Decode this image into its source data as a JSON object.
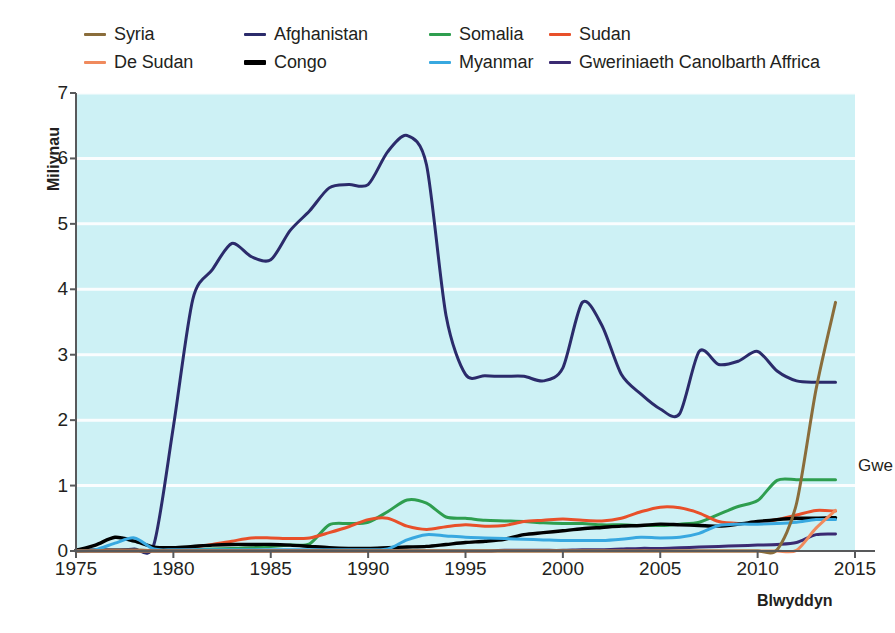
{
  "legend": {
    "items": [
      {
        "label": "Syria",
        "color": "#8a6d3b",
        "thick": false
      },
      {
        "label": "Afghanistan",
        "color": "#2b2b6b",
        "thick": false
      },
      {
        "label": "Somalia",
        "color": "#2e9e4f",
        "thick": false
      },
      {
        "label": "Sudan",
        "color": "#e8502a",
        "thick": false
      },
      {
        "label": "De Sudan",
        "color": "#f08a5d",
        "thick": false
      },
      {
        "label": "Congo",
        "color": "#000000",
        "thick": true
      },
      {
        "label": "Myanmar",
        "color": "#38a8e0",
        "thick": false
      },
      {
        "label": "Gweriniaeth Canolbarth Affrica",
        "color": "#3b2a72",
        "thick": false
      }
    ]
  },
  "annotation_right": "Gwe",
  "style": {
    "plot_background": "#cdf1f5",
    "gridline_color": "#ffffff",
    "axis_color": "#58595b",
    "text_color": "#231f20"
  },
  "chart_data": {
    "type": "line",
    "title": "",
    "xlabel": "Blwyddyn",
    "ylabel": "Miliynau",
    "xlim": [
      1975,
      2015
    ],
    "ylim": [
      0,
      7
    ],
    "xticks": [
      1975,
      1980,
      1985,
      1990,
      1995,
      2000,
      2005,
      2010,
      2015
    ],
    "yticks": [
      0,
      1,
      2,
      3,
      4,
      5,
      6,
      7
    ],
    "grid": "horizontal",
    "legend_position": "above-plot",
    "x": [
      1975,
      1976,
      1977,
      1978,
      1979,
      1980,
      1981,
      1982,
      1983,
      1984,
      1985,
      1986,
      1987,
      1988,
      1989,
      1990,
      1991,
      1992,
      1993,
      1994,
      1995,
      1996,
      1997,
      1998,
      1999,
      2000,
      2001,
      2002,
      2003,
      2004,
      2005,
      2006,
      2007,
      2008,
      2009,
      2010,
      2011,
      2012,
      2013,
      2014
    ],
    "series": [
      {
        "name": "Afghanistan",
        "color": "#2b2b6b",
        "values": [
          0.02,
          0.02,
          0.02,
          0.03,
          0.1,
          1.9,
          3.85,
          4.3,
          4.7,
          4.5,
          4.45,
          4.9,
          5.2,
          5.55,
          5.6,
          5.6,
          6.1,
          6.35,
          5.9,
          3.6,
          2.7,
          2.68,
          2.67,
          2.67,
          2.6,
          2.8,
          3.8,
          3.45,
          2.7,
          2.4,
          2.17,
          2.1,
          3.05,
          2.85,
          2.9,
          3.05,
          2.75,
          2.6,
          2.58,
          2.58
        ]
      },
      {
        "name": "Syria",
        "color": "#8a6d3b",
        "values": [
          0,
          0,
          0,
          0,
          0,
          0,
          0,
          0,
          0,
          0,
          0,
          0,
          0,
          0,
          0,
          0,
          0,
          0,
          0,
          0,
          0,
          0,
          0,
          0,
          0,
          0,
          0,
          0,
          0,
          0,
          0,
          0,
          0,
          0,
          0,
          0,
          0.02,
          0.73,
          2.47,
          3.8
        ]
      },
      {
        "name": "Somalia",
        "color": "#2e9e4f",
        "values": [
          0.01,
          0.01,
          0.01,
          0.01,
          0.01,
          0.02,
          0.02,
          0.03,
          0.04,
          0.05,
          0.07,
          0.09,
          0.11,
          0.4,
          0.42,
          0.44,
          0.6,
          0.78,
          0.73,
          0.52,
          0.5,
          0.47,
          0.46,
          0.45,
          0.43,
          0.42,
          0.42,
          0.4,
          0.4,
          0.39,
          0.39,
          0.41,
          0.44,
          0.56,
          0.68,
          0.77,
          1.08,
          1.09,
          1.09,
          1.09
        ]
      },
      {
        "name": "Sudan",
        "color": "#e8502a",
        "values": [
          0.01,
          0.01,
          0.01,
          0.01,
          0.01,
          0.02,
          0.06,
          0.1,
          0.15,
          0.2,
          0.2,
          0.19,
          0.2,
          0.28,
          0.37,
          0.48,
          0.5,
          0.38,
          0.33,
          0.37,
          0.4,
          0.38,
          0.39,
          0.45,
          0.47,
          0.49,
          0.47,
          0.46,
          0.5,
          0.6,
          0.67,
          0.66,
          0.58,
          0.45,
          0.42,
          0.43,
          0.48,
          0.55,
          0.62,
          0.61
        ]
      },
      {
        "name": "Congo",
        "color": "#000000",
        "values": [
          0.01,
          0.09,
          0.21,
          0.15,
          0.06,
          0.05,
          0.07,
          0.09,
          0.1,
          0.1,
          0.1,
          0.09,
          0.07,
          0.05,
          0.04,
          0.04,
          0.05,
          0.06,
          0.07,
          0.1,
          0.13,
          0.15,
          0.18,
          0.25,
          0.28,
          0.31,
          0.34,
          0.36,
          0.38,
          0.39,
          0.41,
          0.4,
          0.39,
          0.38,
          0.41,
          0.45,
          0.48,
          0.5,
          0.5,
          0.51
        ]
      },
      {
        "name": "Myanmar",
        "color": "#38a8e0",
        "values": [
          0,
          0.02,
          0.12,
          0.2,
          0.03,
          0.02,
          0.02,
          0.02,
          0.02,
          0.02,
          0.02,
          0.02,
          0.02,
          0.02,
          0.02,
          0.02,
          0.03,
          0.17,
          0.25,
          0.23,
          0.21,
          0.2,
          0.19,
          0.18,
          0.17,
          0.16,
          0.16,
          0.16,
          0.18,
          0.21,
          0.2,
          0.21,
          0.27,
          0.39,
          0.41,
          0.41,
          0.42,
          0.44,
          0.48,
          0.48
        ]
      },
      {
        "name": "De Sudan",
        "color": "#f08a5d",
        "values": [
          0,
          0,
          0,
          0,
          0,
          0,
          0,
          0,
          0,
          0,
          0,
          0,
          0,
          0,
          0,
          0,
          0,
          0,
          0,
          0,
          0,
          0,
          0,
          0,
          0,
          0,
          0,
          0,
          0,
          0,
          0,
          0,
          0,
          0,
          0,
          0,
          0,
          0.01,
          0.35,
          0.62
        ]
      },
      {
        "name": "Gweriniaeth Canolbarth Affrica",
        "color": "#3b2a72",
        "values": [
          0,
          0,
          0,
          0,
          0,
          0,
          0,
          0,
          0,
          0,
          0,
          0,
          0,
          0,
          0,
          0,
          0,
          0,
          0,
          0,
          0,
          0,
          0.01,
          0.01,
          0.01,
          0.01,
          0.02,
          0.02,
          0.03,
          0.04,
          0.04,
          0.05,
          0.06,
          0.07,
          0.08,
          0.09,
          0.1,
          0.13,
          0.25,
          0.26
        ]
      }
    ]
  }
}
